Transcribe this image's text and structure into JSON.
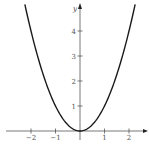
{
  "chart_data": {
    "type": "line",
    "title": "",
    "xlabel": "x",
    "ylabel": "y",
    "function": "y = x^2",
    "series": [
      {
        "name": "y = x^2",
        "x": [
          -2.25,
          -2,
          -1.5,
          -1,
          -0.5,
          0,
          0.5,
          1,
          1.5,
          2,
          2.25
        ],
        "values": [
          5.06,
          4,
          2.25,
          1,
          0.25,
          0,
          0.25,
          1,
          2.25,
          4,
          5.06
        ]
      }
    ],
    "x_ticks": [
      "-2",
      "-1",
      "1",
      "2"
    ],
    "y_ticks": [
      "1",
      "2",
      "3",
      "4"
    ],
    "xlim": [
      -3.2,
      2.8
    ],
    "ylim": [
      0,
      5.2
    ],
    "grid": false,
    "legend": "none"
  },
  "colors": {
    "curve": "#1a1a1a",
    "axis": "#555555"
  }
}
